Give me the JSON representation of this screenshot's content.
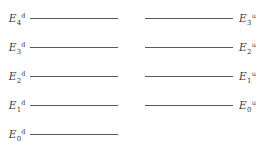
{
  "figure": {
    "type": "energy-level-diagram",
    "background_color": "#ffffff",
    "line_color": "#5a5a5a",
    "text_color": "#3a3a3a"
  },
  "ladders": [
    {
      "id": "down-ladder",
      "name": "left-ladder",
      "superscript": "d",
      "label_side": "left",
      "line_x_start": 30,
      "line_x_end": 118,
      "levels": [
        {
          "symbol": "E",
          "subscript": "4",
          "superscript": "d",
          "y": 18
        },
        {
          "symbol": "E",
          "subscript": "3",
          "superscript": "d",
          "y": 47
        },
        {
          "symbol": "E",
          "subscript": "2",
          "superscript": "d",
          "y": 76
        },
        {
          "symbol": "E",
          "subscript": "1",
          "superscript": "d",
          "y": 105
        },
        {
          "symbol": "E",
          "subscript": "0",
          "superscript": "d",
          "y": 134
        }
      ]
    },
    {
      "id": "up-ladder",
      "name": "right-ladder",
      "superscript": "u",
      "label_side": "right",
      "line_x_start": 145,
      "line_x_end": 233,
      "levels": [
        {
          "symbol": "E",
          "subscript": "3",
          "superscript": "u",
          "y": 18
        },
        {
          "symbol": "E",
          "subscript": "2",
          "superscript": "u",
          "y": 47
        },
        {
          "symbol": "E",
          "subscript": "1",
          "superscript": "u",
          "y": 76
        },
        {
          "symbol": "E",
          "subscript": "0",
          "superscript": "u",
          "y": 105
        }
      ]
    }
  ]
}
